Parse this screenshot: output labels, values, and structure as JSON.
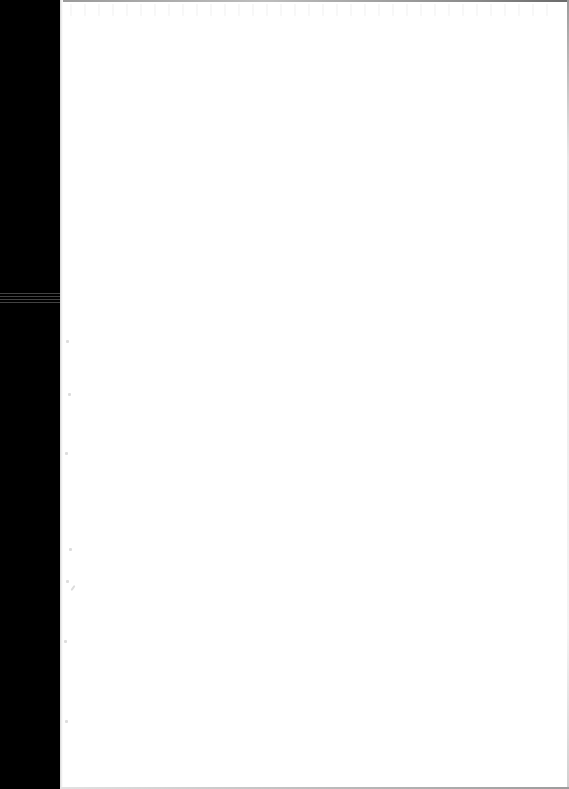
{
  "document": {
    "type": "blank scanned page",
    "visible_text": "",
    "colors": {
      "page_background": "#ffffff",
      "scanner_border": "#000000",
      "edge_shadow": "#9a9a9a"
    }
  }
}
